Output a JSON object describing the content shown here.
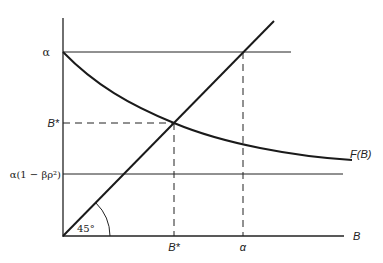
{
  "diagram": {
    "type": "economic-equilibrium-diagram",
    "y_axis": {
      "labels": {
        "alpha": "α",
        "b_star": "B*",
        "lower_bound": "α(1 − βρ²)"
      }
    },
    "x_axis": {
      "label": "B",
      "ticks": {
        "b_star": "B*",
        "alpha": "α"
      }
    },
    "curve_label": "F(B)",
    "angle_label": "45°",
    "colors": {
      "line": "#1a1a1a",
      "background": "#ffffff"
    }
  }
}
